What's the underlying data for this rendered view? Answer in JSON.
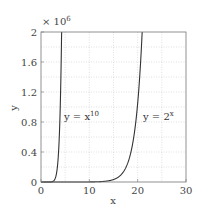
{
  "chart_data": {
    "type": "line",
    "title": "",
    "xlabel": "x",
    "ylabel": "y",
    "xlim": [
      0,
      30
    ],
    "ylim": [
      0,
      2000000
    ],
    "y_multiplier_label": "× 10",
    "y_multiplier_exp": "6",
    "xticks": [
      0,
      10,
      20,
      30
    ],
    "xtick_labels": [
      "0",
      "10",
      "20",
      "30"
    ],
    "yticks": [
      0,
      400000,
      800000,
      1200000,
      1600000,
      2000000
    ],
    "ytick_labels": [
      "0",
      "0.4",
      "0.8",
      "1.2",
      "1.6",
      "2"
    ],
    "grid": true,
    "grid_x_step": 5,
    "grid_y_step": 200000,
    "series": [
      {
        "name": "y = x^10",
        "function": "x^10",
        "label_base": "y = x",
        "label_exp": "10",
        "color": "#333333"
      },
      {
        "name": "y = 2^x",
        "function": "2^x",
        "label_base": "y = 2",
        "label_exp": "x",
        "color": "#333333"
      }
    ]
  }
}
